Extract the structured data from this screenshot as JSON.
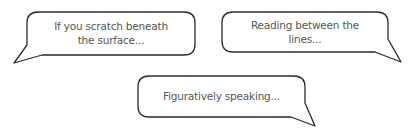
{
  "bubbles": [
    {
      "id": "bubble-1",
      "line1": "If you scratch beneath",
      "line2": "the surface..."
    },
    {
      "id": "bubble-2",
      "line1": "Reading between the",
      "line2": "lines..."
    },
    {
      "id": "bubble-3",
      "line1": "Figuratively speaking..."
    }
  ],
  "colors": {
    "stroke": "#2a2a2a",
    "fill": "#ffffff",
    "text": "#555555"
  }
}
